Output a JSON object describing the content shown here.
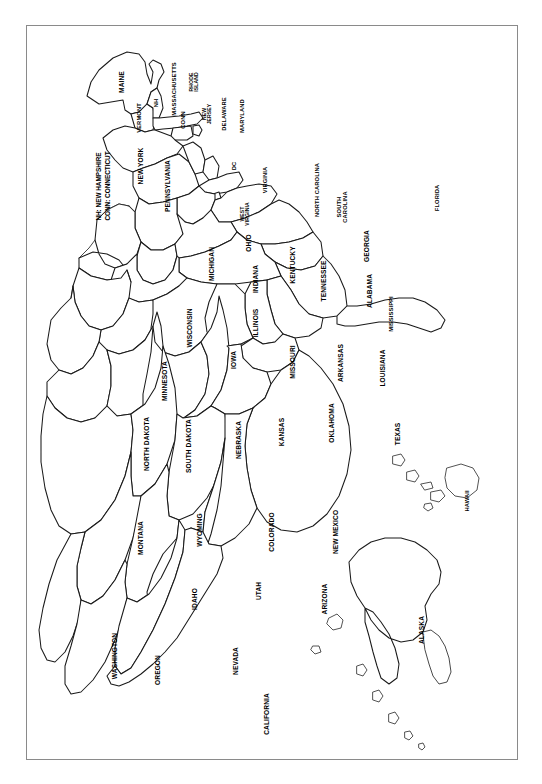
{
  "document": {
    "kind": "map",
    "title": "United States of America — State Outline Map",
    "orientation_note": "Map rendered rotated 90 degrees clockwise; all labels read bottom-to-top.",
    "background_color": "#ffffff",
    "frame_color": "#8a8a8a",
    "outline_color": "#1a1a1a"
  },
  "legend": {
    "name": "abbreviation-key",
    "lines": [
      "NH: NEW HAMPSHIRE",
      "CONN: CONNECTICUT"
    ],
    "text": "NH: NEW HAMPSHIRE\nCONN: CONNECTICUT"
  },
  "map": {
    "region_count": 51,
    "labels": {
      "maine": "MAINE",
      "vermont": "VERMONT",
      "new_hampshire": "NH",
      "massachusetts": "MASSACHUSETTS",
      "rhode_island": "RHODE\nISLAND",
      "connecticut": "CONN",
      "new_york": "NEW YORK",
      "new_jersey": "NEW\nJERSEY",
      "pennsylvania": "PENNSYLVANIA",
      "delaware": "DELAWARE",
      "maryland": "MARYLAND",
      "district_of_columbia": "DC",
      "west_virginia": "WEST\nVIRGINIA",
      "virginia": "VIRGINIA",
      "north_carolina": "NORTH CAROLINA",
      "south_carolina": "SOUTH\nCAROLINA",
      "georgia": "GEORGIA",
      "florida": "FLORIDA",
      "ohio": "OHIO",
      "michigan": "MICHIGAN",
      "indiana": "INDIANA",
      "kentucky": "KENTUCKY",
      "tennessee": "TENNESSEE",
      "alabama": "ALABAMA",
      "mississippi": "MISSISSIPPI",
      "illinois": "ILLINOIS",
      "wisconsin": "WISCONSIN",
      "iowa": "IOWA",
      "missouri": "MISSOURI",
      "arkansas": "ARKANSAS",
      "louisiana": "LOUISIANA",
      "minnesota": "MINNESOTA",
      "north_dakota": "NORTH DAKOTA",
      "south_dakota": "SOUTH DAKOTA",
      "nebraska": "NEBRASKA",
      "kansas": "KANSAS",
      "oklahoma": "OKLAHOMA",
      "texas": "TEXAS",
      "montana": "MONTANA",
      "wyoming": "WYOMING",
      "colorado": "COLORADO",
      "new_mexico": "NEW MEXICO",
      "idaho": "IDAHO",
      "utah": "UTAH",
      "arizona": "ARIZONA",
      "washington": "WASHINGTON",
      "oregon": "OREGON",
      "nevada": "NEVADA",
      "california": "CALIFORNIA",
      "alaska": "ALASKA",
      "hawaii": "HAWAII"
    }
  }
}
